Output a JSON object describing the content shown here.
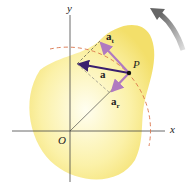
{
  "diagram": {
    "axes": {
      "x_label": "x",
      "y_label": "y",
      "origin_label": "O"
    },
    "point_label": "P",
    "vectors": {
      "acceleration": "a",
      "tangential": {
        "base": "a",
        "sub": "t"
      },
      "radial": {
        "base": "a",
        "sub": "r"
      }
    },
    "colors": {
      "body": "#f7e98a",
      "vector": "#3a1f6e",
      "component": "#b07ac0",
      "arc": "#d9734a",
      "rotation_arrow": "#8a8a8a"
    }
  }
}
